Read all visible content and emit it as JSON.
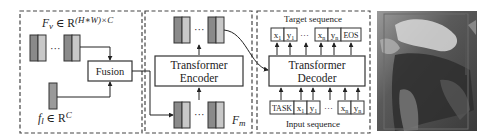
{
  "panel_fusion": {
    "visual_feature_label": "F",
    "visual_feature_sub": "v",
    "visual_feature_set": " ∈ R",
    "visual_feature_sup": "(H∗W)×C",
    "text_feature_label": "f",
    "text_feature_sub": "l",
    "text_feature_set": " ∈ R",
    "text_feature_sup": "C",
    "fusion_label": "Fusion",
    "ellipsis": "···"
  },
  "panel_encoder": {
    "encoder_line1": "Transformer",
    "encoder_line2": "Encoder",
    "memory_label": "F",
    "memory_sub": "m",
    "ellipsis": "···"
  },
  "panel_decoder": {
    "target_label": "Target sequence",
    "input_label": "Input sequence",
    "decoder_line1": "Transformer",
    "decoder_line2": "Decoder",
    "ellipsis": "···",
    "target_tokens": [
      "x1",
      "y1",
      "xn",
      "yn",
      "EOS"
    ],
    "input_tokens": [
      "TASK",
      "x1",
      "y1",
      "xn",
      "yn"
    ],
    "token_x": "x",
    "token_y": "y",
    "sub_1": "1",
    "sub_n": "n",
    "eos": "EOS",
    "task": "TASK"
  },
  "photo": {
    "description": "grayscale photo of a person riding a horse with a bounding box overlay"
  },
  "colors": {
    "token_dark": "#8a8a8a",
    "token_light": "#c8c8c8",
    "stroke": "#333333",
    "dashed": "#444444"
  }
}
